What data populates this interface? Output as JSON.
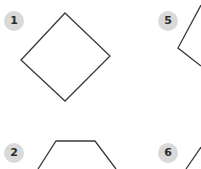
{
  "canvas": {
    "width": 201,
    "height": 169,
    "background_color": "#ffffff"
  },
  "style": {
    "stroke_color": "#3a3a3a",
    "stroke_width": 1.3,
    "shape_fill": "none",
    "badge_background": "#d9d9d9",
    "badge_text_color": "#2b2b2b"
  },
  "layout": {
    "description": "two-by-two grid of cropped geometric shape panels",
    "columns": 2,
    "rows": 2
  },
  "panels": [
    {
      "id": "panel-1",
      "badge_label": "1",
      "shape_name": "diamond",
      "cropped": false,
      "points": "65,13 110,56 65,101 21,60",
      "closed": true
    },
    {
      "id": "panel-5",
      "badge_label": "5",
      "shape_name": "partial-polygon-corner",
      "cropped": true,
      "points": "201,5 178,48 201,66",
      "closed": false
    },
    {
      "id": "panel-2",
      "badge_label": "2",
      "shape_name": "trapezoid",
      "cropped": true,
      "points": "38,169 56,141 95,141 116,169",
      "closed": false
    },
    {
      "id": "panel-6",
      "badge_label": "6",
      "shape_name": "partial-diagonal-edge",
      "cropped": true,
      "points": "186,169 201,147",
      "closed": false
    }
  ]
}
